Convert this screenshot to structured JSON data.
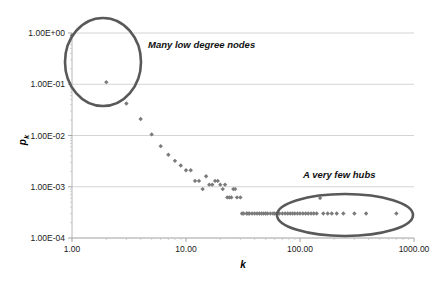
{
  "chart_data": {
    "type": "scatter",
    "title": "",
    "xlabel": "k",
    "ylabel": "p_k",
    "ylabel_display": "p",
    "ylabel_sub": "k",
    "xscale": "log",
    "yscale": "log",
    "xlim": [
      1,
      1000
    ],
    "ylim": [
      0.0001,
      1
    ],
    "grid": true,
    "legend": null,
    "xticks": [
      1,
      10,
      100,
      1000
    ],
    "xtick_labels": [
      "1.00",
      "10.00",
      "100.00",
      "1000.00"
    ],
    "yticks": [
      1,
      0.1,
      0.01,
      0.001,
      0.0001
    ],
    "ytick_labels": [
      "1.00E+00",
      "1.00E-01",
      "1.00E-02",
      "1.00E-03",
      "1.00E-04"
    ],
    "marker": "diamond",
    "marker_color": "#7a7a7a",
    "x": [
      1,
      2,
      3,
      4,
      5,
      6,
      7,
      8,
      9,
      10,
      11,
      12,
      13,
      14,
      15,
      16,
      17,
      18,
      19,
      20,
      21,
      22,
      23,
      24,
      25,
      26,
      27,
      28,
      30,
      31,
      32,
      34,
      35,
      36,
      38,
      40,
      42,
      44,
      46,
      48,
      50,
      52,
      55,
      58,
      60,
      63,
      66,
      70,
      74,
      78,
      82,
      86,
      90,
      95,
      100,
      106,
      112,
      118,
      125,
      132,
      140,
      150,
      160,
      175,
      190,
      210,
      240,
      300,
      380,
      700
    ],
    "y": [
      0.9,
      0.11,
      0.042,
      0.021,
      0.0105,
      0.0062,
      0.0042,
      0.0032,
      0.0026,
      0.0021,
      0.0021,
      0.0013,
      0.0013,
      0.0009,
      0.0016,
      0.0011,
      0.0011,
      0.0013,
      0.0013,
      0.0011,
      0.0009,
      0.0011,
      0.00062,
      0.00062,
      0.00062,
      0.0009,
      0.0009,
      0.00062,
      0.00062,
      0.0003,
      0.0003,
      0.0003,
      0.0003,
      0.0003,
      0.0003,
      0.0003,
      0.0003,
      0.0003,
      0.0003,
      0.0003,
      0.0003,
      0.0003,
      0.0003,
      0.0003,
      0.0003,
      0.0003,
      0.0003,
      0.0003,
      0.0003,
      0.0003,
      0.0003,
      0.0003,
      0.0003,
      0.0003,
      0.0003,
      0.0003,
      0.0003,
      0.0003,
      0.0003,
      0.0003,
      0.0003,
      0.0006,
      0.0003,
      0.0003,
      0.0003,
      0.0003,
      0.0003,
      0.0003,
      0.0003,
      0.0003
    ],
    "annotations": [
      {
        "id": "low-degree",
        "text": "Many low degree nodes",
        "text_x": 148,
        "text_y": 48,
        "ellipse": {
          "cx": 103,
          "cy": 62,
          "rx": 38,
          "ry": 44
        }
      },
      {
        "id": "hubs",
        "text": "A very few hubs",
        "text_x": 303,
        "text_y": 178,
        "ellipse": {
          "cx": 345,
          "cy": 215,
          "rx": 68,
          "ry": 21
        }
      }
    ]
  }
}
